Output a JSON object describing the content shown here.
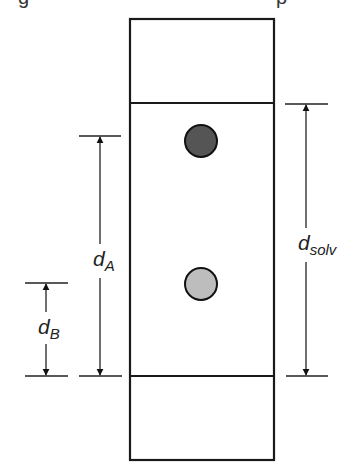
{
  "caption": {
    "clipped_left_fragment": "g",
    "clipped_right_fragment": "p"
  },
  "plate": {
    "outline_color": "#1a1a1a",
    "background": "#ffffff",
    "x": 130,
    "y": 19,
    "width": 144,
    "height": 441,
    "origin_line_y": 376,
    "solvent_front_y": 103
  },
  "spots": [
    {
      "name": "spot-a",
      "cx": 201,
      "cy": 141,
      "r": 16,
      "fill": "#555555"
    },
    {
      "name": "spot-b",
      "cx": 201,
      "cy": 284,
      "r": 16,
      "fill": "#bdbdbd"
    }
  ],
  "dimensions": [
    {
      "name": "d-a",
      "label_main": "d",
      "label_sub": "A",
      "x": 100,
      "y_top": 136,
      "y_bottom": 376,
      "tick_x1": 79,
      "tick_x2": 121,
      "label_x": 95,
      "label_y": 264
    },
    {
      "name": "d-b",
      "label_main": "d",
      "label_sub": "B",
      "x": 46,
      "y_top": 283,
      "y_bottom": 376,
      "tick_x1": 25,
      "tick_x2": 68,
      "label_x": 40,
      "label_y": 334
    },
    {
      "name": "d-solv",
      "label_main": "d",
      "label_sub": "solv",
      "x": 306,
      "y_top": 104,
      "y_bottom": 376,
      "tick_x1": 285,
      "tick_x2": 328,
      "label_x": 301,
      "label_y": 250
    }
  ],
  "labels": {
    "d_a_main": "d",
    "d_a_sub": "A",
    "d_b_main": "d",
    "d_b_sub": "B",
    "d_solv_main": "d",
    "d_solv_sub": "solv"
  }
}
